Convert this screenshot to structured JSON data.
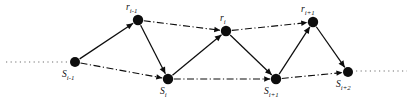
{
  "figure": {
    "type": "node-link-diagram",
    "title": "",
    "background_color": "#ffffff",
    "ink_color": "#0d0d0d",
    "dotted_color": "#6f6f6f",
    "width": 413,
    "height": 109
  },
  "nodes": [
    {
      "id": "s-im1",
      "base": "S",
      "subscript": "i-1",
      "label": "S i-1",
      "x": 75,
      "y": 62,
      "r": 5.0,
      "label_x": 62,
      "label_y": 70,
      "row": "bottom"
    },
    {
      "id": "r-im1",
      "base": "r",
      "subscript": "i-1",
      "label": "r i-1",
      "x": 138,
      "y": 20,
      "r": 5.2,
      "label_x": 126,
      "label_y": 3,
      "row": "top"
    },
    {
      "id": "s-i",
      "base": "S",
      "subscript": "i",
      "label": "S i",
      "x": 168,
      "y": 79,
      "r": 5.2,
      "label_x": 160,
      "label_y": 87,
      "row": "bottom"
    },
    {
      "id": "r-i",
      "base": "r",
      "subscript": "i",
      "label": "r i",
      "x": 226,
      "y": 31,
      "r": 5.2,
      "label_x": 220,
      "label_y": 14,
      "row": "top"
    },
    {
      "id": "s-ip1",
      "base": "S",
      "subscript": "i+1",
      "label": "S i+1",
      "x": 276,
      "y": 79,
      "r": 5.2,
      "label_x": 264,
      "label_y": 87,
      "row": "bottom"
    },
    {
      "id": "r-ip1",
      "base": "r",
      "subscript": "i+1",
      "label": "r i+1",
      "x": 313,
      "y": 22,
      "r": 5.2,
      "label_x": 301,
      "label_y": 5,
      "row": "top"
    },
    {
      "id": "s-ip2",
      "base": "S",
      "subscript": "i+2",
      "label": "S i+2",
      "x": 348,
      "y": 72,
      "r": 5.0,
      "label_x": 336,
      "label_y": 80,
      "row": "bottom"
    }
  ],
  "edges": [
    {
      "id": "e-sim1-rim1",
      "from": "s-im1",
      "to": "r-im1",
      "style": "solid",
      "arrow": true
    },
    {
      "id": "e-rim1-si",
      "from": "r-im1",
      "to": "s-i",
      "style": "solid",
      "arrow": true
    },
    {
      "id": "e-si-ri",
      "from": "s-i",
      "to": "r-i",
      "style": "solid",
      "arrow": true
    },
    {
      "id": "e-ri-sip1",
      "from": "r-i",
      "to": "s-ip1",
      "style": "solid",
      "arrow": true
    },
    {
      "id": "e-sip1-rip1",
      "from": "s-ip1",
      "to": "r-ip1",
      "style": "solid",
      "arrow": true
    },
    {
      "id": "e-rip1-sip2",
      "from": "r-ip1",
      "to": "s-ip2",
      "style": "solid",
      "arrow": true
    },
    {
      "id": "e-rim1-ri",
      "from": "r-im1",
      "to": "r-i",
      "style": "dashdot",
      "arrow": true
    },
    {
      "id": "e-ri-rip1",
      "from": "r-i",
      "to": "r-ip1",
      "style": "dashdot",
      "arrow": true
    },
    {
      "id": "e-sim1-si",
      "from": "s-im1",
      "to": "s-i",
      "style": "dashdot",
      "arrow": true
    },
    {
      "id": "e-si-sip1",
      "from": "s-i",
      "to": "s-ip1",
      "style": "dashdot",
      "arrow": true
    },
    {
      "id": "e-sip1-sip2",
      "from": "s-ip1",
      "to": "s-ip2",
      "style": "dashdot",
      "arrow": true
    }
  ],
  "continuation_lines": [
    {
      "id": "dotted-left",
      "x1": 6,
      "y1": 62,
      "x2": 68,
      "y2": 62,
      "style": "dotted"
    },
    {
      "id": "dotted-right",
      "x1": 356,
      "y1": 71,
      "x2": 407,
      "y2": 71,
      "style": "dotted"
    }
  ]
}
